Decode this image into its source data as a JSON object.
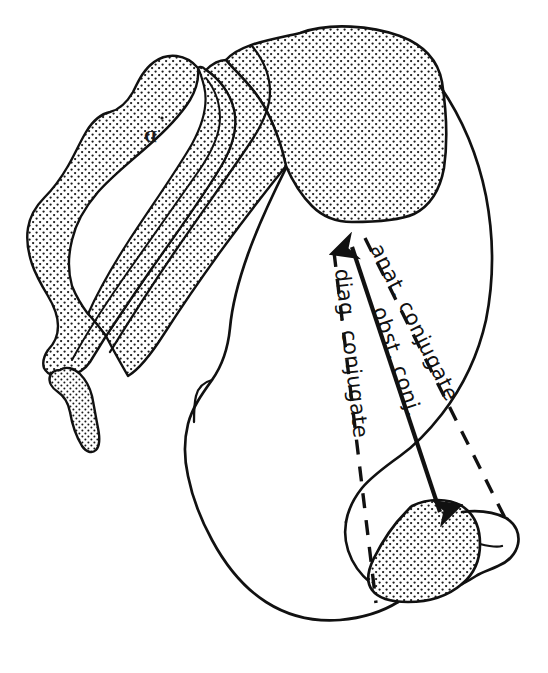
{
  "figure": {
    "background_color": "#ffffff",
    "ink_color": "#111111",
    "stipple_color": "#1a1a1a",
    "width": 548,
    "height": 673
  },
  "annotations": {
    "anat_conjugate": {
      "label": "anat. conjugate",
      "line_style": "dashed",
      "arrowheads": "none",
      "from": "sacral promontory",
      "to": "upper border of pubic symphysis"
    },
    "obst_conj": {
      "label": "obst. conj.",
      "line_style": "solid",
      "arrowheads": "both",
      "from": "sacral promontory",
      "to": "inner-most point of pubic symphysis"
    },
    "diag_conjugate": {
      "label": "diag. conjugate",
      "line_style": "dashed",
      "arrowheads": "none",
      "from": "sacral promontory",
      "to": "lower border of pubic symphysis"
    }
  },
  "marks": {
    "plate_mark": "D"
  },
  "structures": {
    "sacrum": "sacrum",
    "coccyx": "coccyx",
    "ilium": "ilium",
    "sacral_promontory": "sacral promontory",
    "pubic_symphysis": "pubic symphysis",
    "pelvic_outlet": "pelvic outlet"
  }
}
